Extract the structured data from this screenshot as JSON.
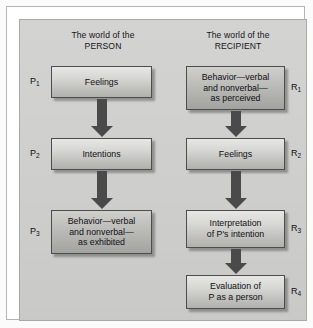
{
  "figure": {
    "columns": [
      {
        "title": "The world of the\nPERSON"
      },
      {
        "title": "The world of the\nRECIPIENT"
      }
    ],
    "person_nodes": [
      {
        "tag": "P",
        "index": "1",
        "text": "Feelings"
      },
      {
        "tag": "P",
        "index": "2",
        "text": "Intentions"
      },
      {
        "tag": "P",
        "index": "3",
        "text": "Behavior—verbal\nand nonverbal—\nas exhibited"
      }
    ],
    "recipient_nodes": [
      {
        "tag": "R",
        "index": "1",
        "text": "Behavior—verbal\nand nonverbal—\nas perceived"
      },
      {
        "tag": "R",
        "index": "2",
        "text": "Feelings"
      },
      {
        "tag": "R",
        "index": "3",
        "text": "Interpretation\nof P's intention"
      },
      {
        "tag": "R",
        "index": "4",
        "text": "Evaluation of\nP as a person"
      }
    ],
    "colors": {
      "panel_background": "#cfcfcd",
      "node_fill_top": "#e7e7e5",
      "node_fill_bottom": "#b0b0ad",
      "node_border": "#4d4d4d",
      "arrow": "#4a4a4a",
      "text": "#101014",
      "frame_border": "#b4b4b4"
    }
  }
}
